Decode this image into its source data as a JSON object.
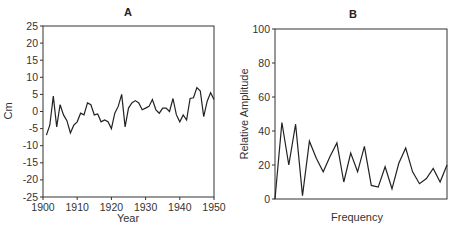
{
  "chart_data": [
    {
      "type": "line",
      "title": "A",
      "xlabel": "Year",
      "ylabel": "Cm",
      "xlim": [
        1900,
        1950
      ],
      "ylim": [
        -25,
        25
      ],
      "xticks": [
        1900,
        1910,
        1920,
        1930,
        1940,
        1950
      ],
      "yticks": [
        25,
        20,
        15,
        10,
        5,
        0,
        -5,
        -10,
        -15,
        -20,
        -25
      ],
      "grid": false,
      "x": [
        1901,
        1902,
        1903,
        1904,
        1905,
        1906,
        1907,
        1908,
        1909,
        1910,
        1911,
        1912,
        1913,
        1914,
        1915,
        1916,
        1917,
        1918,
        1919,
        1920,
        1921,
        1922,
        1923,
        1924,
        1925,
        1926,
        1927,
        1928,
        1929,
        1930,
        1931,
        1932,
        1933,
        1934,
        1935,
        1936,
        1937,
        1938,
        1939,
        1940,
        1941,
        1942,
        1943,
        1944,
        1945,
        1946,
        1947,
        1948,
        1949,
        1950
      ],
      "values": [
        -6.9,
        -4,
        4.5,
        -4.5,
        2,
        -1,
        -2.7,
        -6.3,
        -4,
        -3,
        -0.5,
        -1,
        2.5,
        2,
        -1,
        -0.7,
        -3,
        -2.5,
        -3,
        -5,
        -0.5,
        1.5,
        5,
        -4.5,
        1,
        2.5,
        3.2,
        2.5,
        0.5,
        1,
        1.5,
        3.5,
        0.5,
        -0.5,
        1,
        1,
        0,
        3.8,
        -1,
        -3,
        -1,
        -2.5,
        3.8,
        4,
        7,
        6,
        -1.5,
        3,
        5.5,
        3.5
      ]
    },
    {
      "type": "line",
      "title": "B",
      "xlabel": "Frequency",
      "ylabel": "Relative Amplitude",
      "ylim": [
        0,
        100
      ],
      "yticks": [
        100,
        80,
        60,
        40,
        20,
        0
      ],
      "xticks": [],
      "grid": false,
      "x": [
        0,
        1,
        2,
        3,
        4,
        5,
        6,
        7,
        8,
        9,
        10,
        11,
        12,
        13,
        14,
        15,
        16,
        17,
        18,
        19,
        20,
        21,
        22,
        23,
        24,
        25
      ],
      "values": [
        0,
        45,
        20,
        44,
        2,
        34,
        24,
        16,
        25,
        33,
        10,
        27,
        16,
        31,
        8,
        7,
        19,
        6,
        21,
        30,
        16,
        9,
        12,
        18,
        10,
        20
      ]
    }
  ],
  "panels": {
    "a": {
      "title": "A",
      "xlabel": "Year",
      "ylabel": "Cm"
    },
    "b": {
      "title": "B",
      "xlabel": "Frequency",
      "ylabel": "Relative Amplitude"
    }
  }
}
